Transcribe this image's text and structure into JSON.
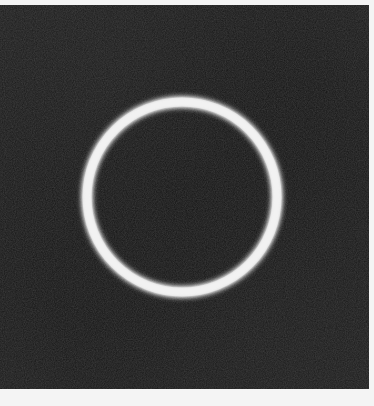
{
  "image": {
    "description": "Glowing white ring on a dark noisy background",
    "background_color": "#141414",
    "border_color": "#f4f4f4",
    "ring": {
      "color": "#f2f2f2",
      "glow_color": "#ffffff",
      "center_x": 182,
      "center_y": 192,
      "radius": 95,
      "stroke_width": 5
    }
  }
}
